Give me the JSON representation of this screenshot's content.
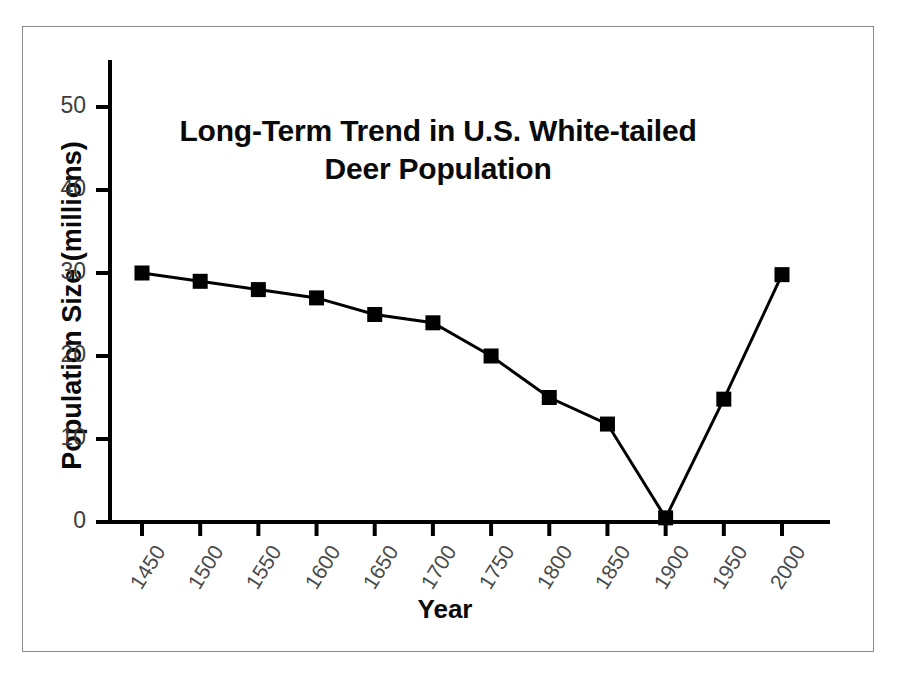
{
  "figure": {
    "border_color": "#8a8a8a",
    "background": "#ffffff"
  },
  "chart_data": {
    "type": "line",
    "title": "Long-Term Trend in U.S. White-tailed Deer Population",
    "title_line1": "Long-Term Trend in U.S. White-tailed",
    "title_line2": "Deer Population",
    "xlabel": "Year",
    "ylabel": "Population Size (millions)",
    "x": [
      1450,
      1500,
      1550,
      1600,
      1650,
      1700,
      1750,
      1800,
      1850,
      1900,
      1950,
      2000
    ],
    "categories": [
      "1450",
      "1500",
      "1550",
      "1600",
      "1650",
      "1700",
      "1750",
      "1800",
      "1850",
      "1900",
      "1950",
      "2000"
    ],
    "values": [
      30,
      29,
      28,
      27,
      25,
      24,
      20,
      15,
      11.8,
      0.5,
      14.8,
      29.8
    ],
    "series": [
      {
        "name": "U.S. White-tailed Deer Population",
        "values": [
          30,
          29,
          28,
          27,
          25,
          24,
          20,
          15,
          11.8,
          0.5,
          14.8,
          29.8
        ]
      }
    ],
    "xlim": [
      1430,
      2030
    ],
    "ylim": [
      0,
      53
    ],
    "ytick_values": [
      0,
      10,
      20,
      30,
      40,
      50
    ],
    "ytick_labels": [
      "0",
      "10",
      "20",
      "30",
      "40",
      "50"
    ],
    "xtick_labels": [
      "1450",
      "1500",
      "1550",
      "1600",
      "1650",
      "1700",
      "1750",
      "1800",
      "1850",
      "1900",
      "1950",
      "2000"
    ],
    "grid": false,
    "legend": false,
    "marker": "square",
    "marker_color": "#000000",
    "line_color": "#000000",
    "line_width": 3,
    "axis_color": "#000000"
  }
}
